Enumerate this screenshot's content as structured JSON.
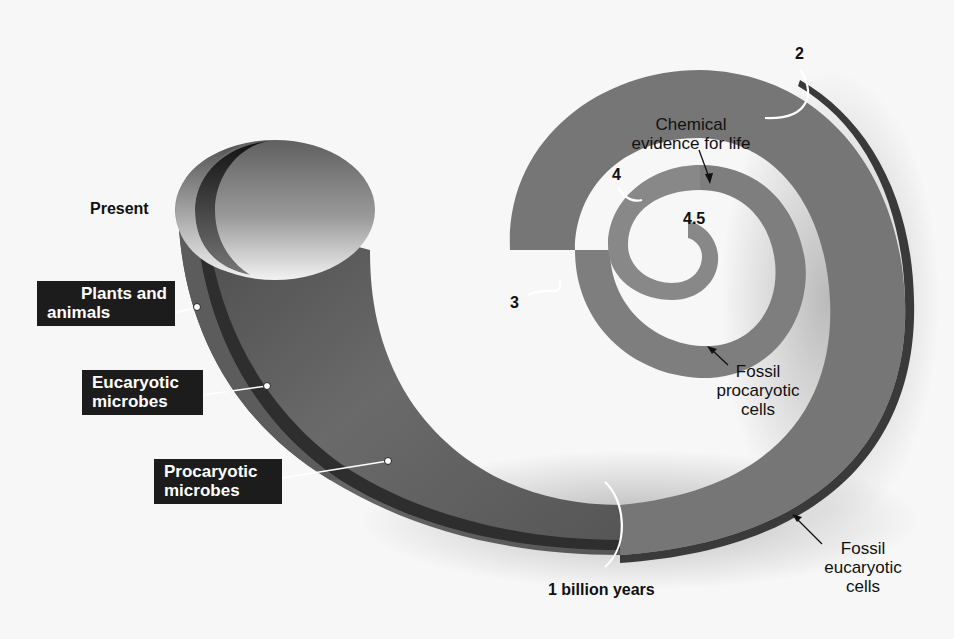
{
  "diagram": {
    "type": "spiral-timeline",
    "colors": {
      "background": "#f7f7f7",
      "procaryotic_band": "#767676",
      "eucaryotic_band": "#3e3e3e",
      "plants_animals_band": "#5a5a5a",
      "outer_shadow": "#2a2a2a",
      "label_box": "#1c1c1c",
      "marker_line": "#ffffff"
    },
    "time_markers": [
      {
        "label": "4.5",
        "meaning": "billion years ago (origin)"
      },
      {
        "label": "4"
      },
      {
        "label": "3"
      },
      {
        "label": "2"
      },
      {
        "label": "1 billion years"
      },
      {
        "label": "Present"
      }
    ],
    "band_labels": [
      {
        "line1": "Plants and",
        "line2": "animals"
      },
      {
        "line1": "Eucaryotic",
        "line2": "microbes"
      },
      {
        "line1": "Procaryotic",
        "line2": "microbes"
      }
    ],
    "annotations": [
      {
        "line1": "Chemical",
        "line2": "evidence for life"
      },
      {
        "line1": "Fossil",
        "line2": "procaryotic",
        "line3": "cells"
      },
      {
        "line1": "Fossil",
        "line2": "eucaryotic",
        "line3": "cells"
      }
    ]
  }
}
